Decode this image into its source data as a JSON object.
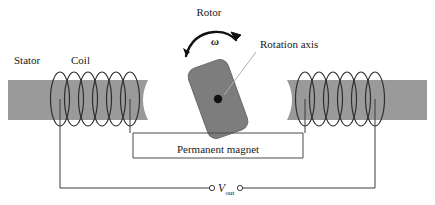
{
  "figure": {
    "width": 435,
    "height": 205,
    "background_color": "#ffffff"
  },
  "labels": {
    "stator": "Stator",
    "coil": "Coil",
    "rotor": "Rotor",
    "rotation_axis": "Rotation axis",
    "permanent_magnet": "Permanent magnet",
    "omega": "ω",
    "v_out_symbol": "V",
    "v_out_subscript": "out"
  },
  "colors": {
    "stator_fill": "#9a9a9a",
    "rotor_fill": "#7d7d7d",
    "rotor_stroke": "#6a6a6a",
    "axis_dot": "#111111",
    "wire": "#3a3a3a",
    "coil": "#2e2e2e",
    "leader": "#b0b0b0",
    "text": "#1a1a1a"
  },
  "components": {
    "stator_left": {
      "name": "left stator pole",
      "coil_turns": 6
    },
    "stator_right": {
      "name": "right stator pole",
      "coil_turns": 6
    },
    "rotor": {
      "name": "rotor permanent magnet",
      "shape": "rounded-rectangle",
      "tilt_degrees": -20,
      "has_rotation_axis_dot": true
    },
    "rotation_direction": "counter-clockwise",
    "output_terminals": 2
  }
}
